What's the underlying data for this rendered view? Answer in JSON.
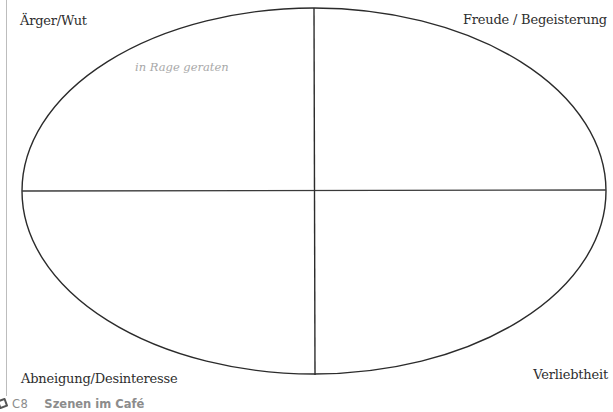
{
  "diagram": {
    "type": "emotion-quadrant-ellipse",
    "quadrants": {
      "top_left": "Ärger/Wut",
      "top_right": "Freude / Begeisterung",
      "bottom_left": "Abneigung/Desinteresse",
      "bottom_right": "Verliebtheit"
    },
    "annotations": [
      {
        "text": "in Rage geraten",
        "quadrant": "top_left",
        "style": "handwritten-gray"
      }
    ],
    "ellipse": {
      "cx": 314,
      "cy": 191,
      "rx": 292,
      "ry": 183,
      "stroke": "#2b2b2b"
    },
    "axes": {
      "horizontal": {
        "y": 191,
        "x1": 22,
        "x2": 606
      },
      "vertical": {
        "x": 315,
        "y1": 8,
        "y2": 375
      }
    }
  },
  "footer": {
    "icon": "pencil-note-icon",
    "code": "C8",
    "title": "Szenen im Café"
  }
}
